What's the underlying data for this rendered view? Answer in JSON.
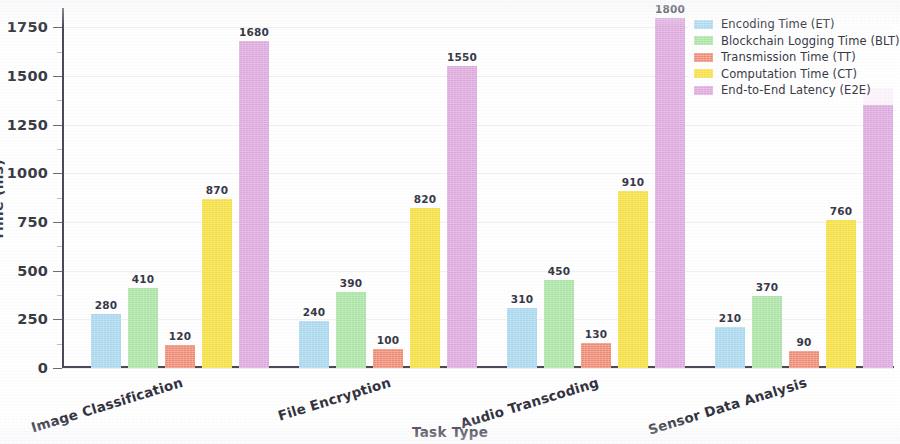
{
  "chart_data": {
    "type": "bar",
    "title": "",
    "xlabel": "Task Type",
    "ylabel": "Time (ms)",
    "categories": [
      "Image Classification",
      "File Encryption",
      "Audio Transcoding",
      "Sensor Data Analysis"
    ],
    "series": [
      {
        "name": "Encoding Time (ET)",
        "color": "#a8d8ef",
        "values": [
          280,
          240,
          310,
          210
        ]
      },
      {
        "name": "Blockchain Logging Time (BLT)",
        "color": "#a9e4a3",
        "values": [
          410,
          390,
          450,
          370
        ]
      },
      {
        "name": "Transmission Time (TT)",
        "color": "#ef8a72",
        "values": [
          120,
          100,
          130,
          90
        ]
      },
      {
        "name": "Computation Time (CT)",
        "color": "#f7e03d",
        "values": [
          870,
          820,
          910,
          760
        ]
      },
      {
        "name": "End-to-End Latency (E2E)",
        "color": "#dda8dd",
        "values": [
          1680,
          1550,
          1800,
          1440
        ]
      }
    ],
    "ylim": [
      0,
      1850
    ],
    "yticks": [
      0,
      250,
      500,
      750,
      1000,
      1250,
      1500,
      1750
    ],
    "ytick_labels": [
      "0",
      "250",
      "500",
      "750",
      "1000",
      "1250",
      "1500",
      "1750"
    ],
    "grid": true,
    "legend_position": "upper right",
    "value_labels_shown": [
      [
        280,
        410,
        120,
        870,
        1680
      ],
      [
        240,
        390,
        100,
        820,
        1550
      ],
      [
        310,
        450,
        130,
        910,
        1800
      ],
      [
        210,
        370,
        90,
        760,
        null
      ]
    ]
  }
}
